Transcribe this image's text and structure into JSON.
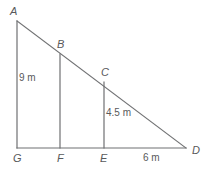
{
  "figure": {
    "type": "geometry-diagram",
    "background_color": "#ffffff",
    "line_color": "#6f7072",
    "text_color": "#58595b",
    "stroke_width": 1.2,
    "vertices": [
      {
        "name": "A",
        "label": "A",
        "x": 17,
        "y": 21,
        "label_x": 10,
        "label_y": 6
      },
      {
        "name": "B",
        "label": "B",
        "x": 60,
        "y": 54,
        "label_x": 57,
        "label_y": 39
      },
      {
        "name": "C",
        "label": "C",
        "x": 104,
        "y": 82,
        "label_x": 101,
        "label_y": 67
      },
      {
        "name": "D",
        "label": "D",
        "x": 186,
        "y": 148,
        "label_x": 192,
        "label_y": 145
      },
      {
        "name": "E",
        "label": "E",
        "x": 104,
        "y": 148,
        "label_x": 100,
        "label_y": 153
      },
      {
        "name": "F",
        "label": "F",
        "x": 60,
        "y": 148,
        "label_x": 57,
        "label_y": 153
      },
      {
        "name": "G",
        "label": "G",
        "x": 17,
        "y": 148,
        "label_x": 13,
        "label_y": 153
      }
    ],
    "segments": [
      {
        "name": "hypotenuse-AD",
        "x1": 17,
        "y1": 21,
        "x2": 186,
        "y2": 148
      },
      {
        "name": "vertical-AG",
        "x1": 17,
        "y1": 21,
        "x2": 17,
        "y2": 148
      },
      {
        "name": "base-GD",
        "x1": 17,
        "y1": 148,
        "x2": 186,
        "y2": 148
      },
      {
        "name": "vertical-BF",
        "x1": 60,
        "y1": 54,
        "x2": 60,
        "y2": 148
      },
      {
        "name": "vertical-CE",
        "x1": 104,
        "y1": 82,
        "x2": 104,
        "y2": 148
      }
    ],
    "measurements": [
      {
        "name": "measure-AG",
        "text": "9 m",
        "x": 19,
        "y": 73
      },
      {
        "name": "measure-CE",
        "text": "4.5 m",
        "x": 106,
        "y": 108
      },
      {
        "name": "measure-ED",
        "text": "6 m",
        "x": 143,
        "y": 153
      }
    ]
  }
}
